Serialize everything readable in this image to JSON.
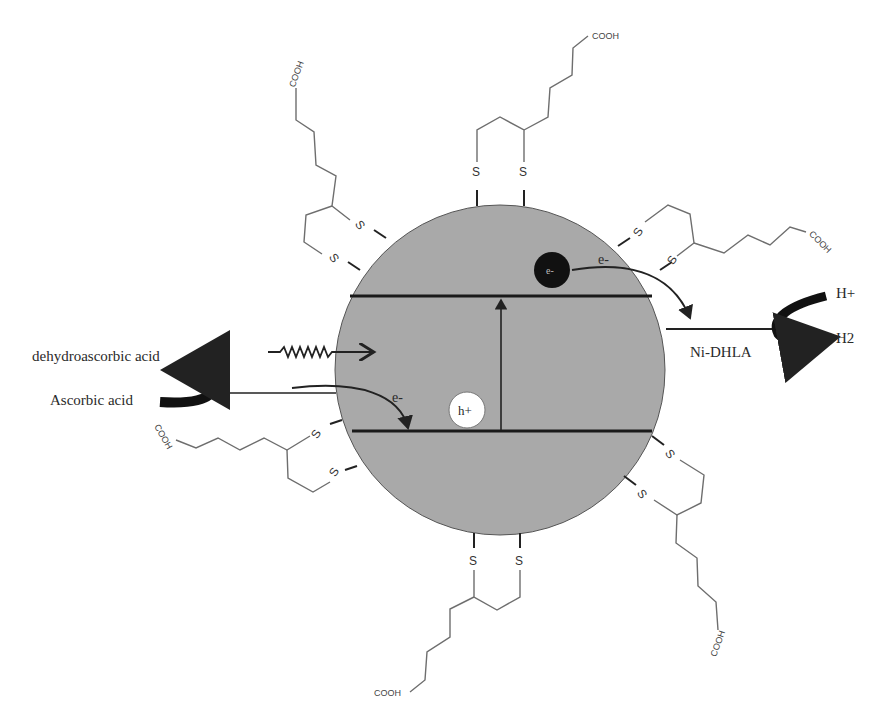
{
  "diagram": {
    "labels": {
      "dehydroascorbic": "dehydroascorbic acid",
      "ascorbic": "Ascorbic acid",
      "catalyst": "Ni-DHLA",
      "h_plus": "H+",
      "h2": "H2",
      "electron_top": "e-",
      "electron_bottom": "e-",
      "electron_symbol": "e-",
      "hole_symbol": "h+"
    },
    "ligand": {
      "sulfur": "S",
      "acid_group": "COOH",
      "count": 6
    },
    "colors": {
      "nanoparticle": "#a9a9a9",
      "band_line": "#1a1a1a",
      "chain": "#6e6e6e",
      "electron": "#111111",
      "hole": "#ffffff"
    }
  }
}
